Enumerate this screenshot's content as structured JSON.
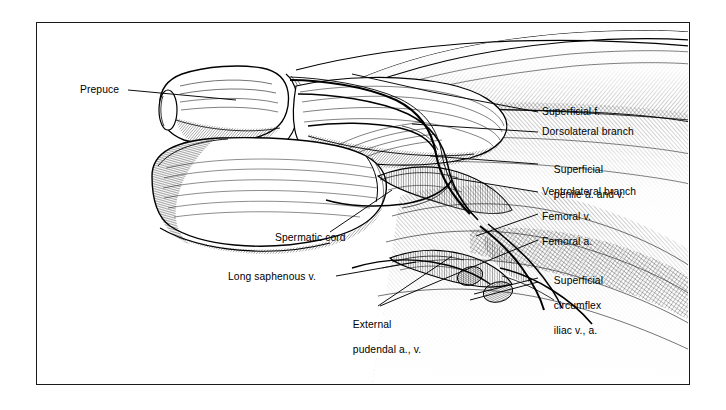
{
  "figure": {
    "kind": "anatomical-illustration",
    "style": "pen-and-ink line drawing with cross-hatching",
    "frame": {
      "border_color": "#1a1a1a",
      "background": "#ffffff"
    },
    "ink_color": "#000000"
  },
  "labels": {
    "left": [
      {
        "id": "prepuce",
        "text": "Prepuce"
      },
      {
        "id": "spermatic-cord",
        "text": "Spermatic cord"
      },
      {
        "id": "long-saphenous",
        "text": "Long saphenous v."
      }
    ],
    "bottom": [
      {
        "id": "external-pudendal",
        "line1": "External",
        "line2": "pudendal a., v."
      }
    ],
    "right": [
      {
        "id": "superficial-f",
        "line1": "Superficial f.",
        "line2": ""
      },
      {
        "id": "dorsolateral-branch",
        "line1": "Dorsolateral branch",
        "line2": ""
      },
      {
        "id": "superficial-penile",
        "line1": "Superficial",
        "line2": "penile a. and v."
      },
      {
        "id": "ventrolateral-branch",
        "line1": "Ventrolateral branch",
        "line2": ""
      },
      {
        "id": "femoral-v",
        "line1": "Femoral v.",
        "line2": ""
      },
      {
        "id": "femoral-a",
        "line1": "Femoral a.",
        "line2": ""
      },
      {
        "id": "superficial-circumflex",
        "line1": "Superficial",
        "line2": "circumflex",
        "line3": "iliac v., a."
      }
    ]
  }
}
